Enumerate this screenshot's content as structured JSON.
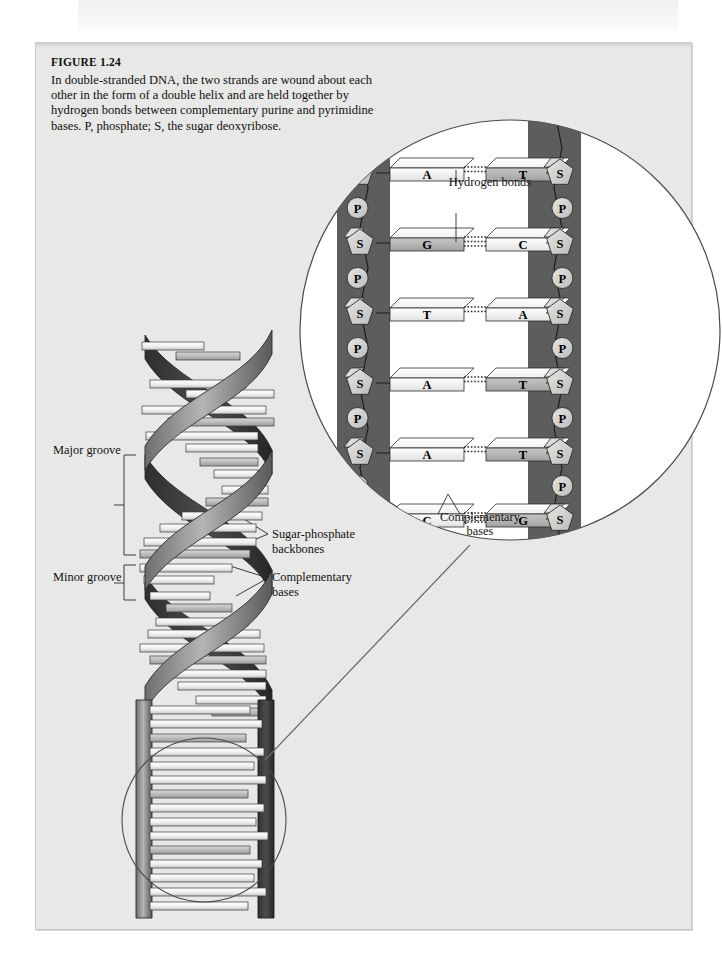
{
  "figure": {
    "number": "FIGURE 1.24",
    "caption": "In double-stranded DNA, the two strands are wound about each other in the form of a double helix and are held together by hydrogen bonds between complementary purine and pyrimidine bases. P, phosphate; S, the sugar deoxyribose."
  },
  "helix_labels": {
    "major_groove": "Major groove",
    "minor_groove": "Minor groove",
    "sugar_phosphate_backbones": "Sugar-phosphate\nbackbones",
    "sugar_phosphate_line1": "Sugar-phosphate",
    "sugar_phosphate_line2": "backbones",
    "complementary_line1": "Complementary",
    "complementary_line2": "bases"
  },
  "inset": {
    "hydrogen_bonds_label": "Hydrogen bonds",
    "complementary_bases_line1": "Complementary",
    "complementary_bases_line2": "bases",
    "sugar_symbol": "S",
    "phosphate_symbol": "P",
    "base_pairs": [
      {
        "left": "A",
        "right": "T",
        "bonds": 2,
        "left_shade": "light",
        "right_shade": "mid"
      },
      {
        "left": "G",
        "right": "C",
        "bonds": 3,
        "left_shade": "mid",
        "right_shade": "light"
      },
      {
        "left": "T",
        "right": "A",
        "bonds": 2,
        "left_shade": "light",
        "right_shade": "light"
      },
      {
        "left": "A",
        "right": "T",
        "bonds": 2,
        "left_shade": "light",
        "right_shade": "mid"
      },
      {
        "left": "A",
        "right": "T",
        "bonds": 2,
        "left_shade": "light",
        "right_shade": "mid"
      },
      {
        "left": "C",
        "right": "G",
        "bonds": 3,
        "left_shade": "light",
        "right_shade": "mid"
      }
    ],
    "left_backbone_units": [
      "S",
      "P",
      "S",
      "P",
      "S",
      "P",
      "S",
      "P",
      "S",
      "P",
      "S"
    ],
    "right_backbone_units": [
      "S",
      "P",
      "S",
      "P",
      "S",
      "P",
      "S",
      "P",
      "S",
      "P",
      "S"
    ]
  },
  "colors": {
    "page_background": "#ffffff",
    "panel_background": "#e8e8e6",
    "backbone_dark": "#5d5d5d",
    "ribbon_dark": "#4a4a4a",
    "ribbon_light": "#9a9a9a",
    "base_light": "#f2f2f0",
    "base_mid": "#b8b8b6",
    "text": "#111111",
    "outline": "#2b2b2b"
  }
}
